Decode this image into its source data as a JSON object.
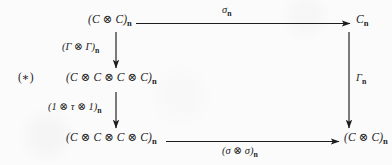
{
  "figure": {
    "kind": "commutative-diagram",
    "tag": "(∗)",
    "background_color": "#fbfbfb",
    "ink_color": "#1d1d1d"
  },
  "nodes": {
    "top_left": {
      "id": "C-tensor-C-n",
      "base": "(C ⊗ C)",
      "subscript": "n"
    },
    "top_right": {
      "id": "C-n",
      "base": "C",
      "subscript": "n"
    },
    "middle_left": {
      "id": "C-tensor-C-tensor-C-tensor-C-n-upper",
      "base": "(C ⊗ C ⊗ C ⊗ C)",
      "subscript": "n"
    },
    "bottom_left": {
      "id": "C-tensor-C-tensor-C-tensor-C-n-lower",
      "base": "(C ⊗ C ⊗ C ⊗ C)",
      "subscript": "n"
    },
    "bottom_right": {
      "id": "C-tensor-C-n-lower",
      "base": "(C ⊗ C)",
      "subscript": "n"
    }
  },
  "edges": {
    "top": {
      "id": "sigma-n",
      "from": "top_left",
      "to": "top_right",
      "label_base": "σ",
      "label_subscript": "n",
      "direction": "right"
    },
    "right": {
      "id": "Gamma-n",
      "from": "top_right",
      "to": "bottom_right",
      "label_base": "Γ",
      "label_subscript": "n",
      "direction": "down"
    },
    "left_1": {
      "id": "Gamma-tensor-Gamma-n",
      "from": "top_left",
      "to": "middle_left",
      "label_base": "(Γ ⊗ Γ)",
      "label_subscript": "n",
      "direction": "down"
    },
    "left_2": {
      "id": "one-tensor-tau-tensor-one-n",
      "from": "middle_left",
      "to": "bottom_left",
      "label_base": "(1 ⊗ τ ⊗ 1)",
      "label_subscript": "n",
      "direction": "down"
    },
    "bottom": {
      "id": "sigma-tensor-sigma-n",
      "from": "bottom_left",
      "to": "bottom_right",
      "label_base": "(σ ⊗ σ)",
      "label_subscript": "n",
      "direction": "right"
    }
  }
}
